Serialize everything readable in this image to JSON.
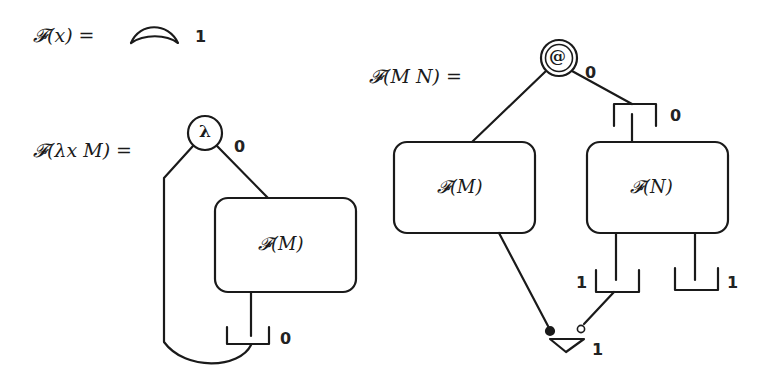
{
  "equations": {
    "variable": {
      "lhs": "𝓕(x) =",
      "node_label": "1"
    },
    "abstraction": {
      "lhs": "𝓕(λx M) =",
      "node_symbol": "λ",
      "node_label": "0",
      "box_label": "𝓕(M)",
      "bracket_label": "0"
    },
    "application": {
      "lhs": "𝓕(M N) =",
      "node_symbol": "@",
      "node_label": "0",
      "top_bracket_label": "0",
      "box_left_label": "𝓕(M)",
      "box_right_label": "𝓕(N)",
      "bottom_left_bracket_label": "1",
      "bottom_right_bracket_label": "1",
      "triangle_label": "1"
    }
  },
  "colors": {
    "stroke": "#1a1a1a",
    "background": "#ffffff"
  }
}
